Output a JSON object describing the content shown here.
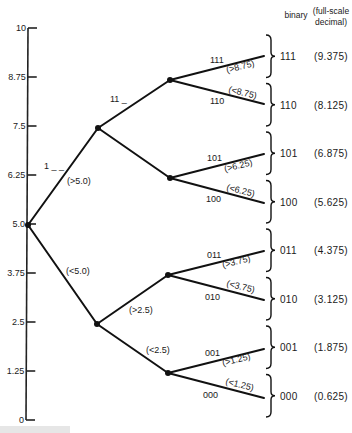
{
  "diagram": {
    "axis": {
      "ticks": [
        "10",
        "8.75",
        "7.5",
        "6.25",
        "5.0",
        "3.75",
        "2.5",
        "1.25",
        "0"
      ]
    },
    "headers": {
      "binary": "binary",
      "decimal_line1": "(full-scale",
      "decimal_line2": "decimal)"
    },
    "level1": {
      "upper_code": "1 _ _",
      "upper_condition": "(>5.0)",
      "lower_condition": "(<5.0)"
    },
    "level2": {
      "upper_code": "11 _",
      "upper_low_condition": "(>2.5)",
      "lower_low_condition": "(<2.5)"
    },
    "branches": [
      {
        "code": "111",
        "condition": "(>8.75)"
      },
      {
        "code": "110",
        "condition": "(<8.75)"
      },
      {
        "code": "101",
        "condition": "(>6.25)"
      },
      {
        "code": "100",
        "condition": "(<6.25)"
      },
      {
        "code": "011",
        "condition": "(>3.75)"
      },
      {
        "code": "010",
        "condition": "(<3.75)"
      },
      {
        "code": "001",
        "condition": "(>1.25)"
      },
      {
        "code": "000",
        "condition": "(<1.25)"
      }
    ],
    "outputs": [
      {
        "binary": "111",
        "decimal": "(9.375)"
      },
      {
        "binary": "110",
        "decimal": "(8.125)"
      },
      {
        "binary": "101",
        "decimal": "(6.875)"
      },
      {
        "binary": "100",
        "decimal": "(5.625)"
      },
      {
        "binary": "011",
        "decimal": "(4.375)"
      },
      {
        "binary": "010",
        "decimal": "(3.125)"
      },
      {
        "binary": "001",
        "decimal": "(1.875)"
      },
      {
        "binary": "000",
        "decimal": "(0.625)"
      }
    ]
  }
}
